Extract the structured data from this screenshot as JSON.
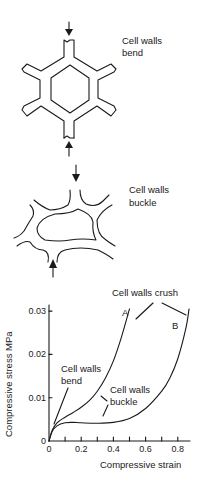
{
  "panels": [
    {
      "id": "honeycomb",
      "label_lines": [
        "Cell walls",
        "bend"
      ]
    },
    {
      "id": "buckled",
      "label_lines": [
        "Cell walls",
        "buckle"
      ]
    }
  ],
  "chart_data": {
    "type": "line",
    "title": "",
    "xlabel": "Compressive strain",
    "ylabel": "Compressive stress MPa",
    "xlim": [
      0,
      0.9
    ],
    "ylim": [
      0,
      0.032
    ],
    "xticks": [
      0,
      0.1,
      0.2,
      0.3,
      0.4,
      0.5,
      0.6,
      0.7,
      0.8
    ],
    "xtick_labels": [
      "0",
      "",
      "0.2",
      "",
      "0.4",
      "",
      "0.6",
      "",
      "0.8"
    ],
    "yticks": [
      0,
      0.01,
      0.02,
      0.03
    ],
    "ytick_labels": [
      "0",
      "0.01",
      "0.02",
      "0.03"
    ],
    "grid": false,
    "series": [
      {
        "name": "A",
        "x": [
          0,
          0.02,
          0.05,
          0.1,
          0.15,
          0.2,
          0.25,
          0.3,
          0.35,
          0.4,
          0.45,
          0.5
        ],
        "y": [
          0,
          0.0025,
          0.0042,
          0.0055,
          0.0066,
          0.0078,
          0.0093,
          0.0115,
          0.0145,
          0.0185,
          0.024,
          0.0305
        ]
      },
      {
        "name": "B",
        "x": [
          0,
          0.02,
          0.05,
          0.1,
          0.15,
          0.2,
          0.3,
          0.4,
          0.5,
          0.6,
          0.7,
          0.75,
          0.8,
          0.85,
          0.87
        ],
        "y": [
          0,
          0.0022,
          0.0035,
          0.0042,
          0.0043,
          0.0042,
          0.0041,
          0.0043,
          0.0052,
          0.0075,
          0.0115,
          0.0145,
          0.019,
          0.026,
          0.0305
        ]
      }
    ],
    "annotations": [
      {
        "text_lines": [
          "Cell walls crush"
        ],
        "targets": [
          "A",
          "B"
        ]
      },
      {
        "text_lines": [
          "Cell walls",
          "bend"
        ],
        "target": "initial linear region"
      },
      {
        "text_lines": [
          "Cell walls",
          "buckle"
        ],
        "targets": [
          "A",
          "B"
        ]
      },
      {
        "text_lines": [
          "A"
        ],
        "target": "A"
      },
      {
        "text_lines": [
          "B"
        ],
        "target": "B"
      }
    ]
  }
}
